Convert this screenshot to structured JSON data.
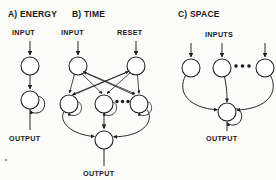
{
  "figure": {
    "title_a": "A) ENERGY",
    "title_b": "B) TIME",
    "title_c": "C) SPACE",
    "label_input_a": "INPUT",
    "label_output_a": "OUTPUT",
    "label_input_b": "INPUT",
    "label_reset_b": "RESET",
    "label_output_b": "OUTPUT",
    "label_inputs_c": "INPUTS",
    "label_output_c": "OUTPUT",
    "ellipsis_b": "•••",
    "ellipsis_c": "•••",
    "ink_color": "#1d1d1d",
    "paper_color": "#fbfbfa"
  },
  "diagram_data": {
    "type": "diagram",
    "style": "neural network schematic, black line art on white",
    "panels": [
      {
        "id": "a",
        "title": "A) ENERGY",
        "nodes": [
          {
            "id": "a1",
            "cx": 30,
            "cy": 66,
            "r": 9,
            "self_loop": false
          },
          {
            "id": "a2",
            "cx": 30,
            "cy": 100,
            "r": 9,
            "self_loop": true
          }
        ],
        "inputs": [
          {
            "label": "INPUT",
            "x": 30,
            "y_from": 42,
            "y_to": 56
          }
        ],
        "outputs": [
          {
            "label": "OUTPUT",
            "x": 30,
            "y_from": 109,
            "y_to": 130
          }
        ],
        "edges": [
          {
            "from": "a1",
            "to": "a2",
            "kind": "arrow-down"
          }
        ]
      },
      {
        "id": "b",
        "title": "B) TIME",
        "nodes": [
          {
            "id": "b_in",
            "cx": 78,
            "cy": 66,
            "r": 9,
            "self_loop": false
          },
          {
            "id": "b_rst",
            "cx": 136,
            "cy": 66,
            "r": 9,
            "self_loop": false
          },
          {
            "id": "b_h1",
            "cx": 69,
            "cy": 104,
            "r": 9,
            "self_loop": true
          },
          {
            "id": "b_h2",
            "cx": 104,
            "cy": 104,
            "r": 9,
            "self_loop": true
          },
          {
            "id": "b_h3",
            "cx": 139,
            "cy": 104,
            "r": 9,
            "self_loop": true
          },
          {
            "id": "b_out",
            "cx": 104,
            "cy": 140,
            "r": 9,
            "self_loop": false
          }
        ],
        "inputs": [
          {
            "label": "INPUT",
            "x": 78,
            "y_from": 42,
            "y_to": 56
          },
          {
            "label": "RESET",
            "x": 136,
            "y_from": 42,
            "y_to": 56
          }
        ],
        "outputs": [
          {
            "label": "OUTPUT",
            "x": 104,
            "y_from": 149,
            "y_to": 166
          }
        ],
        "edges": [
          {
            "from": "b_in",
            "to": "b_h1",
            "kind": "arrow"
          },
          {
            "from": "b_in",
            "to": "b_h2",
            "kind": "arrow"
          },
          {
            "from": "b_in",
            "to": "b_h3",
            "kind": "arrow"
          },
          {
            "from": "b_rst",
            "to": "b_h1",
            "kind": "arrow"
          },
          {
            "from": "b_rst",
            "to": "b_h2",
            "kind": "arrow"
          },
          {
            "from": "b_rst",
            "to": "b_h3",
            "kind": "arrow"
          },
          {
            "from": "b_h1",
            "to": "b_rst",
            "kind": "arrow-up"
          },
          {
            "from": "b_h3",
            "to": "b_in",
            "kind": "arrow-up"
          },
          {
            "from": "b_h1",
            "to": "b_out",
            "kind": "arrow-curve"
          },
          {
            "from": "b_h2",
            "to": "b_out",
            "kind": "arrow-down"
          },
          {
            "from": "b_h3",
            "to": "b_out",
            "kind": "arrow-curve"
          }
        ],
        "ellipsis_between": [
          "b_h2",
          "b_h3"
        ]
      },
      {
        "id": "c",
        "title": "C) SPACE",
        "nodes": [
          {
            "id": "c1",
            "cx": 191,
            "cy": 68,
            "r": 9,
            "self_loop": false
          },
          {
            "id": "c2",
            "cx": 222,
            "cy": 68,
            "r": 9,
            "self_loop": false
          },
          {
            "id": "c3",
            "cx": 265,
            "cy": 68,
            "r": 9,
            "self_loop": false
          },
          {
            "id": "c_out",
            "cx": 227,
            "cy": 112,
            "r": 9,
            "self_loop": true
          }
        ],
        "inputs": [
          {
            "label": "INPUTS",
            "x": 191,
            "y_from": 44,
            "y_to": 58
          },
          {
            "label": "INPUTS",
            "x": 222,
            "y_from": 44,
            "y_to": 58
          },
          {
            "label": "INPUTS",
            "x": 265,
            "y_from": 44,
            "y_to": 58
          }
        ],
        "outputs": [
          {
            "label": "OUTPUT",
            "x": 227,
            "y_from": 121,
            "y_to": 140
          }
        ],
        "edges": [
          {
            "from": "c1",
            "to": "c_out",
            "kind": "arrow-curve"
          },
          {
            "from": "c2",
            "to": "c_out",
            "kind": "arrow-curve"
          },
          {
            "from": "c3",
            "to": "c_out",
            "kind": "arrow-curve"
          }
        ],
        "ellipsis_between": [
          "c2",
          "c3"
        ]
      }
    ]
  }
}
